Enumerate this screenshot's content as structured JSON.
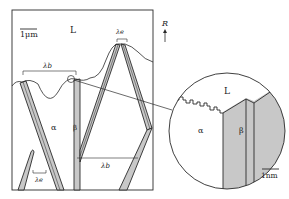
{
  "figure": {
    "main_panel": {
      "scale_bar_label": "1μm",
      "liquid_label": "L",
      "alpha_label": "α",
      "beta_label": "β",
      "lambda_e_top": "λe",
      "lambda_b_top": "λb",
      "lambda_e_bottom": "λe",
      "lambda_b_bottom": "λb"
    },
    "growth_direction": {
      "label": "R",
      "arrow": "up-arrow"
    },
    "inset": {
      "liquid_label": "L",
      "alpha_label": "α",
      "beta_label": "β",
      "scale_bar_label": "1nm"
    },
    "colors": {
      "line": "#2a2a2a",
      "phase_fill": "#c8c8c8",
      "background": "#ffffff"
    }
  }
}
